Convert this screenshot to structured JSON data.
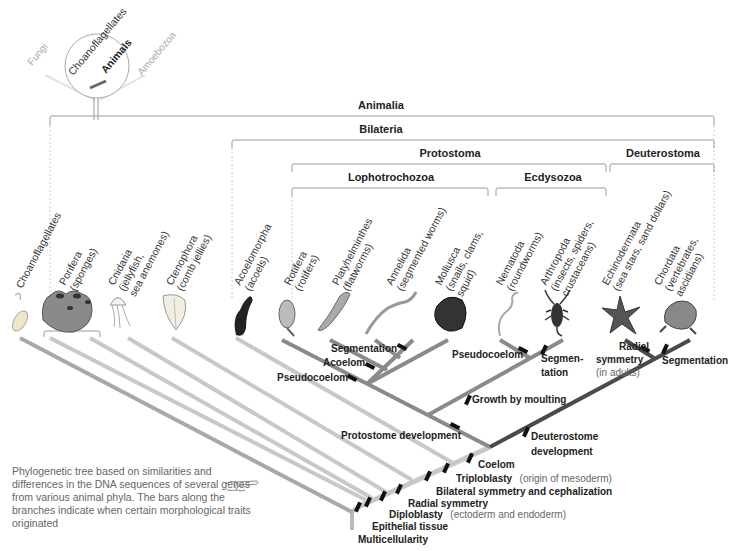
{
  "inset": {
    "groups": [
      "Fungi",
      "Choanoflagellates",
      "Animals",
      "Amoebozoa"
    ]
  },
  "clades": {
    "animalia": "Animalia",
    "bilateria": "Bilateria",
    "protostoma": "Protostoma",
    "deuterostoma": "Deuterostoma",
    "lophotrochozoa": "Lophotrochozoa",
    "ecdysozoa": "Ecdysozoa"
  },
  "taxa": [
    {
      "name": "Choanoflagellates",
      "common": ""
    },
    {
      "name": "Porifera",
      "common": "(sponges)"
    },
    {
      "name": "Cnidaria",
      "common": "(jellyfish,",
      "common2": "sea anemones)"
    },
    {
      "name": "Ctenophora",
      "common": "(comb jellies)"
    },
    {
      "name": "Acoelomorpha",
      "common": "(acoels)"
    },
    {
      "name": "Rotifera",
      "common": "(rotifers)"
    },
    {
      "name": "Platyhelminthes",
      "common": "(flatworms)"
    },
    {
      "name": "Annelida",
      "common": "(segmented worms)"
    },
    {
      "name": "Mollusca",
      "common": "(snails, clams,",
      "common2": "squid)"
    },
    {
      "name": "Nematoda",
      "common": "(roundworms)"
    },
    {
      "name": "Arthropoda",
      "common": "(insects, spiders,",
      "common2": "crustaceans)"
    },
    {
      "name": "Echinodermata",
      "common": "(sea stars, sand dollars)"
    },
    {
      "name": "Chordata",
      "common": "(vertebrates,",
      "common2": "ascidians)"
    }
  ],
  "traits": {
    "segmentation_lopho": "Segmentation",
    "acoelom": "Acoelom",
    "pseudocoelom_lopho": "Pseudocoelom",
    "pseudocoelom_ecdy": "Pseudocoelom",
    "segmentation_ecdy_1": "Segmen-",
    "segmentation_ecdy_2": "tation",
    "radial_adult_1": "Radial",
    "radial_adult_2": "symmetry",
    "radial_adult_note": "(in adults)",
    "segmentation_chordata": "Segmentation",
    "growth_by_moulting": "Growth by moulting",
    "protostome_dev": "Protostome development",
    "deuterostome_dev_1": "Deuterostome",
    "deuterostome_dev_2": "development",
    "coelom": "Coelom",
    "triploblasty": "Triploblasty",
    "triploblasty_note": "(origin of mesoderm)",
    "bilateral": "Bilateral symmetry and cephalization",
    "radial": "Radial symmetry",
    "diploblasty": "Diploblasty",
    "diploblasty_note": "(ectoderm and endoderm)",
    "epithelial": "Epithelial tissue",
    "multicellularity": "Multicellularity"
  },
  "caption": "Phylogenetic tree based on similarities and differences in the DNA sequences of several genes from various animal phyla. The bars along the branches indicate when certain morphological traits originated",
  "icons": {
    "pointer": "pointing-hand-icon"
  },
  "colors": {
    "light_branch": "#c8c8c8",
    "mid_branch": "#8a8a8a",
    "dark_branch": "#4a4a4a",
    "bracket": "#9a9a9a",
    "bar": "#111111"
  }
}
